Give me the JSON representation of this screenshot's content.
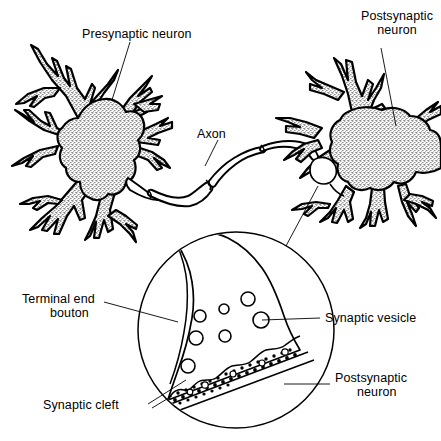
{
  "figure": {
    "background_color": "#ffffff",
    "ink_color": "#000000"
  },
  "labels": {
    "presynaptic_neuron": "Presynaptic neuron",
    "postsynaptic_neuron_top_line1": "Postsynaptic",
    "postsynaptic_neuron_top_line2": "neuron",
    "axon": "Axon",
    "terminal_end_line1": "Terminal end",
    "terminal_end_line2": "bouton",
    "synaptic_vesicle": "Synaptic vesicle",
    "synaptic_cleft": "Synaptic cleft",
    "postsynaptic_neuron_inset_line1": "Postsynaptic",
    "postsynaptic_neuron_inset_line2": "neuron"
  },
  "inset": {
    "magnifier_center_x": 236,
    "magnifier_center_y": 330,
    "magnifier_radius": 98,
    "vesicle_count": 7,
    "vesicles": [
      {
        "cx": 248,
        "cy": 299,
        "r": 7
      },
      {
        "cx": 224,
        "cy": 309,
        "r": 5
      },
      {
        "cx": 200,
        "cy": 316,
        "r": 6
      },
      {
        "cx": 261,
        "cy": 320,
        "r": 8
      },
      {
        "cx": 196,
        "cy": 338,
        "r": 7
      },
      {
        "cx": 225,
        "cy": 336,
        "r": 6
      },
      {
        "cx": 188,
        "cy": 366,
        "r": 7
      }
    ]
  }
}
